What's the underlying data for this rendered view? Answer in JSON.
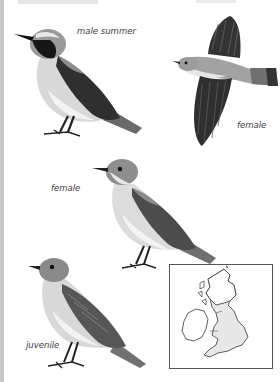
{
  "page": {
    "type": "field-guide-plate",
    "species_group": "wheatear"
  },
  "illustrations": [
    {
      "label": "male summer",
      "pose": "standing",
      "colors": {
        "mask": "#1a1a1a",
        "back": "#8a8a8a",
        "wing": "#2e2e2e",
        "breast": "#d6d6d6",
        "belly": "#f2f2f2"
      }
    },
    {
      "label": "female",
      "pose": "flight",
      "colors": {
        "head": "#9a9a9a",
        "wing": "#333333",
        "tail": "#6f6f6f"
      }
    },
    {
      "label": "female",
      "pose": "standing",
      "colors": {
        "head": "#8c8c8c",
        "wing": "#4a4a4a",
        "breast": "#e2e2e2"
      }
    },
    {
      "label": "juvenile",
      "pose": "standing",
      "colors": {
        "head": "#888888",
        "wing": "#555555",
        "breast": "#d9d9d9"
      }
    }
  ],
  "map": {
    "title": "distribution map",
    "region": "British Isles",
    "border_color": "#555555",
    "range_fill": "#e8e8e8"
  }
}
